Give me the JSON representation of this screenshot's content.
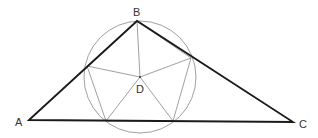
{
  "diagram": {
    "type": "geometry",
    "colors": {
      "thick_line": "#1a1a1a",
      "thin_line": "#888888",
      "circle": "#888888",
      "label": "#333333",
      "background": "#ffffff"
    },
    "points": {
      "A": {
        "label": "A",
        "x": 29,
        "y": 120
      },
      "B": {
        "label": "B",
        "x": 137,
        "y": 21
      },
      "C": {
        "label": "C",
        "x": 293,
        "y": 122
      },
      "D": {
        "label": "D",
        "x": 140,
        "y": 77
      }
    },
    "intersections": {
      "P_AB": {
        "x": 87,
        "y": 66
      },
      "P_BC": {
        "x": 191,
        "y": 58
      },
      "P_AC1": {
        "x": 106,
        "y": 121
      },
      "P_AC2": {
        "x": 173,
        "y": 121
      }
    },
    "circle": {
      "cx": 140,
      "cy": 77,
      "r": 56
    },
    "labels": {
      "A": "A",
      "B": "B",
      "C": "C",
      "D": "D"
    }
  }
}
